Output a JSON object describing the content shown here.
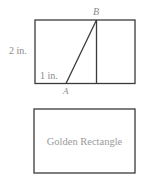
{
  "figure_top": {
    "labels": {
      "point_b": "B",
      "point_a": "A",
      "height": "2 in.",
      "base": "1 in."
    },
    "geometry": {
      "outer_rect": {
        "x": 35,
        "y": 20,
        "width": 100,
        "height": 63.5
      },
      "square_divider_x": 96.5,
      "diagonal": {
        "from": {
          "x": 66,
          "y": 83.5
        },
        "to": {
          "x": 96.5,
          "y": 20
        }
      }
    }
  },
  "figure_bottom": {
    "caption": "Golden Rectangle",
    "rect": {
      "x": 34,
      "y": 109,
      "width": 101,
      "height": 64
    }
  },
  "colors": {
    "stroke": "#3a3a3a",
    "label": "#8a8a8a",
    "background": "#ffffff"
  }
}
